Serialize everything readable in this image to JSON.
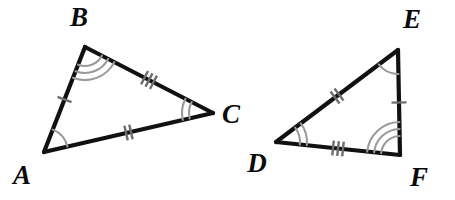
{
  "diagram": {
    "background_color": "#ffffff",
    "edge_color": "#111111",
    "arc_color": "#9a9a9a",
    "tick_color": "#6e6e6e",
    "label_color": "#0b0b0b",
    "triangles": [
      {
        "name": "triangle-abc",
        "vertices": [
          {
            "label": "A",
            "name": "vertex-a",
            "x": 44,
            "y": 152,
            "label_x": 22,
            "label_y": 178,
            "arc_count": 1
          },
          {
            "label": "B",
            "name": "vertex-b",
            "x": 85,
            "y": 47,
            "label_x": 79,
            "label_y": 20,
            "arc_count": 3
          },
          {
            "label": "C",
            "name": "vertex-c",
            "x": 213,
            "y": 113,
            "label_x": 231,
            "label_y": 117,
            "arc_count": 2
          }
        ],
        "sides": [
          {
            "name": "side-ab",
            "from": "A",
            "to": "B",
            "tick_count": 1
          },
          {
            "name": "side-bc",
            "from": "B",
            "to": "C",
            "tick_count": 3
          },
          {
            "name": "side-ac",
            "from": "A",
            "to": "C",
            "tick_count": 2
          }
        ]
      },
      {
        "name": "triangle-def",
        "vertices": [
          {
            "label": "D",
            "name": "vertex-d",
            "x": 276,
            "y": 142,
            "label_x": 257,
            "label_y": 166,
            "arc_count": 2
          },
          {
            "label": "E",
            "name": "vertex-e",
            "x": 398,
            "y": 50,
            "label_x": 412,
            "label_y": 22,
            "arc_count": 1
          },
          {
            "label": "F",
            "name": "vertex-f",
            "x": 400,
            "y": 155,
            "label_x": 419,
            "label_y": 180,
            "arc_count": 3
          }
        ],
        "sides": [
          {
            "name": "side-de",
            "from": "D",
            "to": "E",
            "tick_count": 2
          },
          {
            "name": "side-ef",
            "from": "E",
            "to": "F",
            "tick_count": 1
          },
          {
            "name": "side-df",
            "from": "D",
            "to": "F",
            "tick_count": 3
          }
        ]
      }
    ]
  }
}
